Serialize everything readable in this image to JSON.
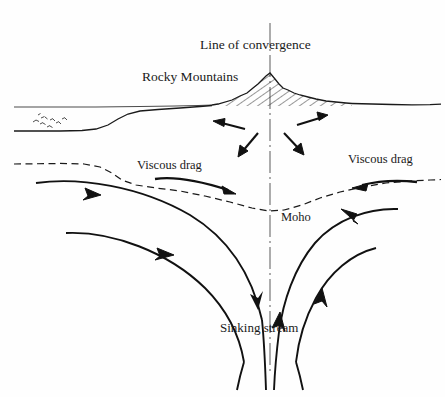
{
  "figure": {
    "width": 445,
    "height": 397,
    "background_color": "#fefefe",
    "ink_color": "#1a1a1a"
  },
  "labels": {
    "line_of_convergence": "Line of convergence",
    "rocky_mountains": "Rocky Mountains",
    "viscous_drag_left": "Viscous drag",
    "viscous_drag_right": "Viscous drag",
    "moho": "Moho",
    "sinking_stream": "Sinking stream"
  },
  "elements": {
    "center_axis": "line-of-convergence-axis",
    "mountain": "hatched-mountain-range",
    "ocean_surface": "sea-level-line",
    "seafloor": "ocean-floor-profile",
    "sediment_marks": "sediment-symbol-cluster",
    "moho_boundary": "moho-dashed-boundary",
    "surface_arrows": "crustal-divergence-arrows",
    "drag_arrow_left": "viscous-drag-arrow-left",
    "drag_arrow_right": "viscous-drag-arrow-right",
    "flow_left_outer": "mantle-flow-line-left-upper",
    "flow_left_inner": "mantle-flow-line-left-lower",
    "flow_right_outer": "mantle-flow-line-right-upper",
    "flow_right_inner": "mantle-flow-line-right-lower",
    "downwelling": "sinking-stream-lines"
  }
}
